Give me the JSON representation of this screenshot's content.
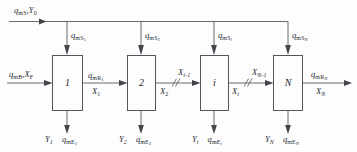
{
  "diagram": {
    "stages": [
      {
        "id": "stage-1",
        "number": "1",
        "feed_label_main": "q",
        "feed_sub": "mS",
        "feed_sub2": "1",
        "bottom_y": "Y",
        "bottom_y_sub": "1",
        "bottom_q": "q",
        "bottom_q_sub": "mE",
        "bottom_q_sub2": "1"
      },
      {
        "id": "stage-2",
        "number": "2",
        "feed_label_main": "q",
        "feed_sub": "mS",
        "feed_sub2": "2",
        "bottom_y": "Y",
        "bottom_y_sub": "2",
        "bottom_q": "q",
        "bottom_q_sub": "mE",
        "bottom_q_sub2": "2"
      },
      {
        "id": "stage-i",
        "number": "i",
        "feed_label_main": "q",
        "feed_sub": "mS",
        "feed_sub2": "i",
        "bottom_y": "Y",
        "bottom_y_sub": "i",
        "bottom_q": "q",
        "bottom_q_sub": "mE",
        "bottom_q_sub2": "i"
      },
      {
        "id": "stage-N",
        "number": "N",
        "feed_label_main": "q",
        "feed_sub": "mS",
        "feed_sub2": "N",
        "bottom_y": "Y",
        "bottom_y_sub": "N",
        "bottom_q": "q",
        "bottom_q_sub": "mE",
        "bottom_q_sub2": "N"
      }
    ],
    "top_inlet": {
      "q": "q",
      "q_sub": "mS",
      "y": "Y",
      "y_sub": "0",
      "separator": ","
    },
    "left_inlet": {
      "q": "q",
      "q_sub": "mB",
      "x": "X",
      "x_sub": "F",
      "separator": ","
    },
    "right_outlet": {
      "q": "q",
      "q_sub": "mR",
      "q_sub2": "N",
      "x": "X",
      "x_sub": "N"
    },
    "connectors": [
      {
        "id": "conn-1-2",
        "top_main": "q",
        "top_sub": "mR",
        "top_sub2": "1",
        "bottom_main": "X",
        "bottom_sub": "1",
        "break": false
      },
      {
        "id": "conn-2-i",
        "top_main": "X",
        "top_sub": "i-1",
        "bottom_main": "X",
        "bottom_sub": "2",
        "break": true
      },
      {
        "id": "conn-i-N",
        "top_main": "X",
        "top_sub": "N-1",
        "bottom_main": "X",
        "bottom_sub": "i",
        "break": true
      }
    ],
    "colors": {
      "stroke": "#44444c",
      "text": "#2b2b33",
      "background": "#fdfdfd"
    }
  }
}
